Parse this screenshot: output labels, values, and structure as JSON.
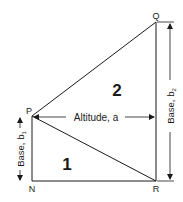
{
  "diagram": {
    "vertices": {
      "P": {
        "label": "P"
      },
      "Q": {
        "label": "Q"
      },
      "N": {
        "label": "N"
      },
      "R": {
        "label": "R"
      }
    },
    "regions": {
      "triangle1": {
        "label": "1"
      },
      "triangle2": {
        "label": "2"
      }
    },
    "dimensions": {
      "altitude": {
        "label": "Altitude, a"
      },
      "base1": {
        "label": "Base, b",
        "subscript": "1"
      },
      "base2": {
        "label": "Base, b",
        "subscript": "2"
      }
    },
    "colors": {
      "line": "#1a1a1a",
      "background": "#ffffff"
    }
  }
}
